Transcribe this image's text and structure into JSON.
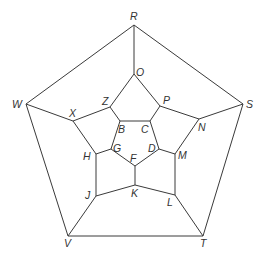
{
  "diagram": {
    "type": "dodecahedron-graph",
    "line_color": "#3a3a3a",
    "label_color": "#333333",
    "vertices": {
      "R": {
        "x": 134,
        "y": 25
      },
      "O": {
        "x": 134,
        "y": 74
      },
      "Z": {
        "x": 110,
        "y": 107
      },
      "P": {
        "x": 160,
        "y": 106
      },
      "B": {
        "x": 120,
        "y": 121
      },
      "C": {
        "x": 150,
        "y": 121
      },
      "G": {
        "x": 111,
        "y": 149
      },
      "D": {
        "x": 159,
        "y": 149
      },
      "F": {
        "x": 135,
        "y": 166
      },
      "X": {
        "x": 73,
        "y": 121
      },
      "N": {
        "x": 199,
        "y": 119
      },
      "H": {
        "x": 96,
        "y": 154
      },
      "M": {
        "x": 175,
        "y": 154
      },
      "J": {
        "x": 96,
        "y": 196
      },
      "K": {
        "x": 135,
        "y": 185
      },
      "L": {
        "x": 175,
        "y": 195
      },
      "W": {
        "x": 26,
        "y": 104
      },
      "S": {
        "x": 243,
        "y": 104
      },
      "V": {
        "x": 68,
        "y": 236
      },
      "T": {
        "x": 203,
        "y": 236
      }
    },
    "labels": [
      {
        "text": "R",
        "x": 130,
        "y": 20
      },
      {
        "text": "O",
        "x": 136,
        "y": 76
      },
      {
        "text": "Z",
        "x": 102,
        "y": 105
      },
      {
        "text": "P",
        "x": 163,
        "y": 104
      },
      {
        "text": "B",
        "x": 118,
        "y": 133
      },
      {
        "text": "C",
        "x": 141,
        "y": 133
      },
      {
        "text": "G",
        "x": 113,
        "y": 152
      },
      {
        "text": "D",
        "x": 148,
        "y": 152
      },
      {
        "text": "F",
        "x": 130,
        "y": 162
      },
      {
        "text": "X",
        "x": 69,
        "y": 117
      },
      {
        "text": "N",
        "x": 198,
        "y": 131
      },
      {
        "text": "H",
        "x": 83,
        "y": 160
      },
      {
        "text": "M",
        "x": 178,
        "y": 159
      },
      {
        "text": "J",
        "x": 85,
        "y": 199
      },
      {
        "text": "K",
        "x": 131,
        "y": 197
      },
      {
        "text": "L",
        "x": 167,
        "y": 206
      },
      {
        "text": "W",
        "x": 12,
        "y": 108
      },
      {
        "text": "S",
        "x": 246,
        "y": 108
      },
      {
        "text": "V",
        "x": 64,
        "y": 247
      },
      {
        "text": "T",
        "x": 200,
        "y": 247
      }
    ],
    "edges": [
      [
        "R",
        "W"
      ],
      [
        "R",
        "S"
      ],
      [
        "S",
        "T"
      ],
      [
        "T",
        "V"
      ],
      [
        "V",
        "W"
      ],
      [
        "R",
        "O"
      ],
      [
        "S",
        "N"
      ],
      [
        "T",
        "L"
      ],
      [
        "V",
        "J"
      ],
      [
        "W",
        "X"
      ],
      [
        "O",
        "Z"
      ],
      [
        "O",
        "P"
      ],
      [
        "Z",
        "X"
      ],
      [
        "P",
        "N"
      ],
      [
        "Z",
        "B"
      ],
      [
        "P",
        "C"
      ],
      [
        "B",
        "C"
      ],
      [
        "B",
        "G"
      ],
      [
        "C",
        "D"
      ],
      [
        "G",
        "F"
      ],
      [
        "D",
        "F"
      ],
      [
        "F",
        "K"
      ],
      [
        "X",
        "H"
      ],
      [
        "N",
        "M"
      ],
      [
        "H",
        "G"
      ],
      [
        "M",
        "D"
      ],
      [
        "H",
        "J"
      ],
      [
        "M",
        "L"
      ],
      [
        "J",
        "K"
      ],
      [
        "K",
        "L"
      ]
    ]
  }
}
